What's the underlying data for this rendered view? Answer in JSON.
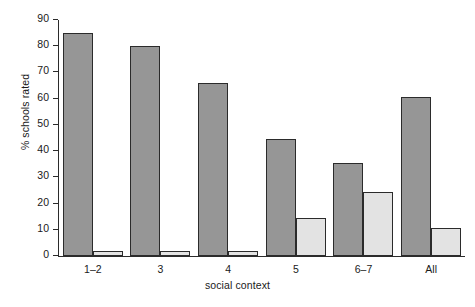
{
  "chart_data": {
    "type": "bar",
    "title": "",
    "xlabel": "social context",
    "ylabel": "% schools rated",
    "categories": [
      "1–2",
      "3",
      "4",
      "5",
      "6–7",
      "All"
    ],
    "series": [
      {
        "name": "dark",
        "color": "#969696",
        "values": [
          85,
          80,
          66,
          44.5,
          35.5,
          60.5
        ]
      },
      {
        "name": "light",
        "color": "#e3e3e3",
        "values": [
          2,
          2,
          2,
          14.5,
          24.5,
          10.5
        ]
      }
    ],
    "ylim": [
      0,
      90
    ],
    "yticks": [
      0,
      10,
      20,
      30,
      40,
      50,
      60,
      70,
      80,
      90
    ],
    "ytick_labels": [
      "0",
      "10",
      "20",
      "30",
      "40",
      "50",
      "60",
      "70",
      "80",
      "90"
    ],
    "grid": false,
    "legend": false,
    "legend_position": "none",
    "axis_color": "#2b2b2b",
    "background_color": "#ffffff"
  }
}
